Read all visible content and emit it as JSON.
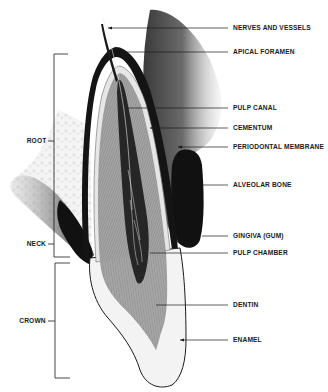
{
  "diagram": {
    "right_labels": [
      {
        "id": "nerves",
        "text": "NERVES AND VESSELS",
        "y": 28
      },
      {
        "id": "apical",
        "text": "APICAL FORAMEN",
        "y": 52
      },
      {
        "id": "pulp_canal",
        "text": "PULP CANAL",
        "y": 108
      },
      {
        "id": "cementum",
        "text": "CEMENTUM",
        "y": 128
      },
      {
        "id": "periodontal",
        "text": "PERIODONTAL MEMBRANE",
        "y": 147
      },
      {
        "id": "alveolar",
        "text": "ALVEOLAR BONE",
        "y": 185
      },
      {
        "id": "gingiva",
        "text": "GINGIVA (GUM)",
        "y": 236
      },
      {
        "id": "pulp_chamber",
        "text": "PULP CHAMBER",
        "y": 253
      },
      {
        "id": "dentin",
        "text": "DENTIN",
        "y": 305
      },
      {
        "id": "enamel",
        "text": "ENAMEL",
        "y": 340
      }
    ],
    "left_labels": [
      {
        "id": "root",
        "text": "ROOT",
        "y": 141
      },
      {
        "id": "neck",
        "text": "NECK",
        "y": 244
      },
      {
        "id": "crown",
        "text": "CROWN",
        "y": 321
      }
    ],
    "brackets": {
      "root": {
        "top": 54,
        "bottom": 257
      },
      "crown": {
        "top": 263,
        "bottom": 378
      }
    },
    "colors": {
      "ink": "#1a1a1a",
      "dentin": "#9a9a9a",
      "pulp": "#2a2a2a",
      "enamel": "#f2f2f2",
      "gum": "#111111",
      "bone_shadow": "#5a5a5a"
    }
  }
}
